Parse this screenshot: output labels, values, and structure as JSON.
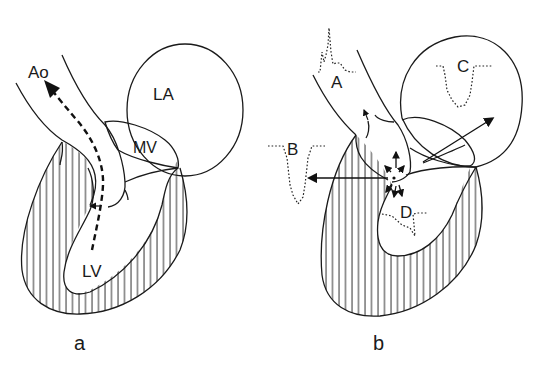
{
  "figure": {
    "panels": [
      {
        "id": "a",
        "caption": "a",
        "labels": {
          "aorta": "Ao",
          "left_atrium": "LA",
          "mitral_valve": "MV",
          "left_ventricle": "LV"
        },
        "annotation": "Dashed arrow: normal flow from LV through outflow tract into Ao"
      },
      {
        "id": "b",
        "caption": "b",
        "labels": {
          "a": "A",
          "b": "B",
          "c": "C",
          "d": "D"
        },
        "annotation": "Obstruction point with flow arrows toward A (aorta), B (outward), C (LA via MV regurgitation), D (LV)"
      }
    ],
    "colors": {
      "line": "#1a1a1a",
      "background": "#ffffff"
    }
  }
}
